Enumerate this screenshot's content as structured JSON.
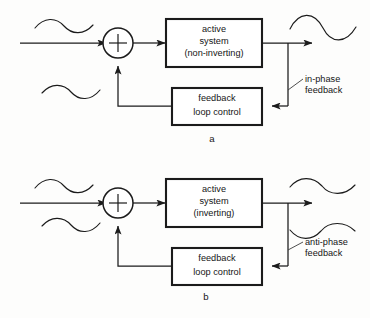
{
  "figure": {
    "background_color": "#fdfdfc",
    "line_color": "#1b1b1b",
    "panels": [
      {
        "id": "a",
        "label": "a",
        "active_system": {
          "line1": "active",
          "line2": "system",
          "line3": "(non-inverting)"
        },
        "feedback_block": {
          "line1": "feedback",
          "line2": "loop control"
        },
        "summing_junction": {
          "sign": "+"
        },
        "annotation": {
          "line1": "in-phase",
          "line2": "feedback"
        },
        "waveforms": [
          {
            "name": "input-signal-waveform",
            "phase": "positive-first",
            "amplitude": "small"
          },
          {
            "name": "feedback-signal-waveform",
            "phase": "positive-first",
            "amplitude": "small"
          },
          {
            "name": "output-signal-waveform",
            "phase": "positive-first",
            "amplitude": "large"
          }
        ]
      },
      {
        "id": "b",
        "label": "b",
        "active_system": {
          "line1": "active",
          "line2": "system",
          "line3": "(inverting)"
        },
        "feedback_block": {
          "line1": "feedback",
          "line2": "loop control"
        },
        "summing_junction": {
          "sign": "+"
        },
        "annotation": {
          "line1": "anti-phase",
          "line2": "feedback"
        },
        "waveforms": [
          {
            "name": "input-signal-waveform",
            "phase": "positive-first",
            "amplitude": "small"
          },
          {
            "name": "feedback-signal-waveform",
            "phase": "positive-first",
            "amplitude": "small"
          },
          {
            "name": "output-signal-waveform",
            "phase": "positive-first",
            "amplitude": "small"
          },
          {
            "name": "antiphase-feedback-waveform",
            "phase": "negative-first",
            "amplitude": "small"
          }
        ]
      }
    ]
  }
}
